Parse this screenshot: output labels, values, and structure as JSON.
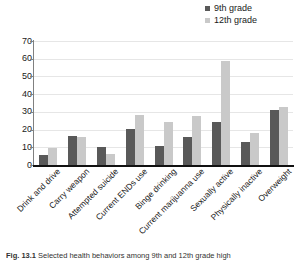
{
  "figure": {
    "caption_label": "Fig. 13.1",
    "caption_text": "Selected health behaviors among 9th and 12th grade high"
  },
  "chart_data": {
    "type": "bar",
    "title": "",
    "xlabel": "",
    "ylabel": "",
    "ylim": [
      0,
      70
    ],
    "yticks": [
      0,
      10,
      20,
      30,
      40,
      50,
      60,
      70
    ],
    "grid": true,
    "legend_position": "top-right",
    "categories": [
      "Drink and drive",
      "Carry weapon",
      "Attempted suicide",
      "Current ENDs use",
      "Binge drinking",
      "Current marijuanna use",
      "Sexually active",
      "Physically inactive",
      "Overweight"
    ],
    "series": [
      {
        "name": "9th grade",
        "color": "#595959",
        "values": [
          5.5,
          16.5,
          10.3,
          20.6,
          11,
          16,
          24.5,
          13,
          31
        ]
      },
      {
        "name": "12th grade",
        "color": "#c9c9c9",
        "values": [
          9.7,
          15.6,
          6.3,
          28.5,
          24.5,
          27.8,
          58.8,
          17.8,
          33
        ]
      }
    ]
  }
}
